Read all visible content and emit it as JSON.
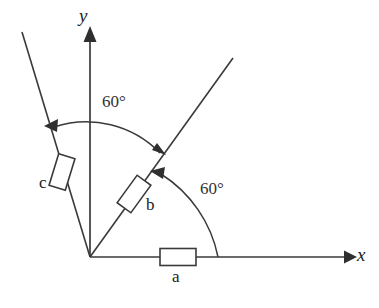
{
  "figure": {
    "type": "geometry-diagram",
    "background_color": "#ffffff",
    "stroke_color": "#3a3a3a",
    "text_color": "#222222",
    "width": 379,
    "height": 308
  },
  "axes": {
    "origin": {
      "x": 90,
      "y": 257
    },
    "x_axis": {
      "label": "x",
      "label_pos": {
        "x": 357,
        "y": 248
      },
      "start": {
        "x": 90,
        "y": 257
      },
      "end": {
        "x": 352,
        "y": 257
      },
      "arrowhead": "right"
    },
    "y_axis": {
      "label": "y",
      "label_pos": {
        "x": 79,
        "y": 6
      },
      "start": {
        "x": 90,
        "y": 257
      },
      "end": {
        "x": 90,
        "y": 28
      },
      "arrowhead": "up"
    }
  },
  "rays": [
    {
      "name": "ray-b",
      "angle_deg_from_x_axis": 60,
      "start": {
        "x": 90,
        "y": 257
      },
      "end": {
        "x": 233,
        "y": 58
      }
    },
    {
      "name": "ray-c",
      "angle_deg_from_x_axis": 110,
      "start": {
        "x": 90,
        "y": 257
      },
      "end": {
        "x": 22,
        "y": 32
      }
    }
  ],
  "components": [
    {
      "id": "a",
      "label": "a",
      "shape": "rectangle",
      "on": "x-axis",
      "center": {
        "x": 178,
        "y": 257
      },
      "rotation_deg": 0,
      "size": {
        "w": 36,
        "h": 17
      },
      "label_pos": {
        "x": 172,
        "y": 268
      }
    },
    {
      "id": "b",
      "label": "b",
      "shape": "rectangle",
      "on": "ray-b",
      "center": {
        "x": 134,
        "y": 194
      },
      "rotation_deg": -54,
      "size": {
        "w": 34,
        "h": 17
      },
      "label_pos": {
        "x": 146,
        "y": 196
      }
    },
    {
      "id": "c",
      "label": "c",
      "shape": "rectangle",
      "on": "ray-c",
      "center": {
        "x": 62,
        "y": 172
      },
      "rotation_deg": -73,
      "size": {
        "w": 33,
        "h": 17
      },
      "label_pos": {
        "x": 39,
        "y": 174
      }
    }
  ],
  "angle_arcs": [
    {
      "id": "angle-upper",
      "label": "60°",
      "label_pos": {
        "x": 102,
        "y": 93
      },
      "from": "y-axis",
      "to": "ray-b",
      "radius": 103,
      "arrowheads": "both",
      "start_point": {
        "x": 48,
        "y": 125
      },
      "end_point": {
        "x": 163,
        "y": 151
      }
    },
    {
      "id": "angle-lower",
      "label": "60°",
      "label_pos": {
        "x": 200,
        "y": 180
      },
      "from": "x-axis",
      "to": "ray-b",
      "radius": 128,
      "arrowheads": "single",
      "start_point": {
        "x": 218,
        "y": 257
      },
      "end_point": {
        "x": 156,
        "y": 172
      }
    }
  ]
}
